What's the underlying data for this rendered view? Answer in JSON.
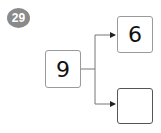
{
  "problem": {
    "number": "29"
  },
  "diagram": {
    "source": {
      "value": "9"
    },
    "targets": [
      {
        "value": "6"
      },
      {
        "value": ""
      }
    ]
  },
  "colors": {
    "badge": "#8a8a8a",
    "line": "#777777",
    "box_border": "#9a9a9a",
    "empty_box_border": "#555555"
  }
}
